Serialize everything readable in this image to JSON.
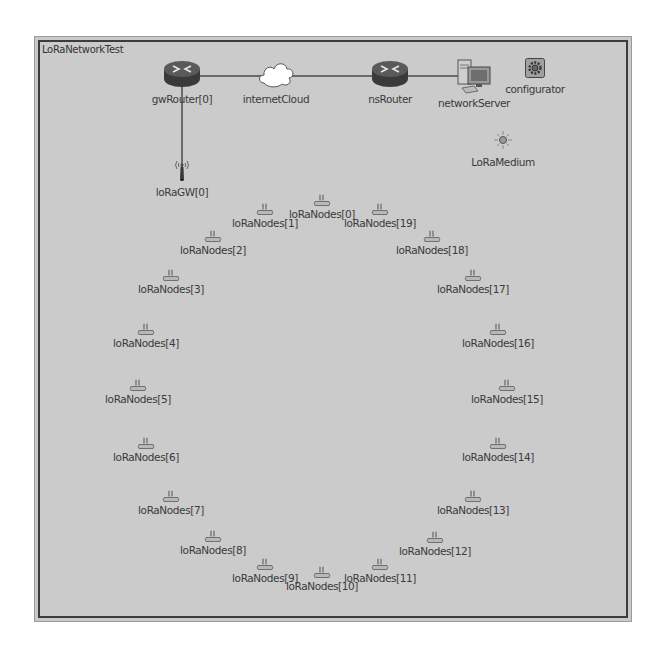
{
  "network": {
    "title": "LoRaNetworkTest",
    "background": "#cbcbcb",
    "border_color": "#3c3c3c"
  },
  "modules": {
    "gwRouter": {
      "label": "gwRouter[0]",
      "icon": "router-icon"
    },
    "internetCloud": {
      "label": "internetCloud",
      "icon": "cloud-icon"
    },
    "nsRouter": {
      "label": "nsRouter",
      "icon": "router-icon"
    },
    "networkServer": {
      "label": "networkServer",
      "icon": "server-icon"
    },
    "configurator": {
      "label": "configurator",
      "icon": "gear-icon"
    },
    "loRaMedium": {
      "label": "LoRaMedium",
      "icon": "radio-medium-icon"
    },
    "loRaGW": {
      "label": "loRaGW[0]",
      "icon": "antenna-icon"
    }
  },
  "links": [
    {
      "from": "gwRouter[0]",
      "to": "internetCloud"
    },
    {
      "from": "internetCloud",
      "to": "nsRouter"
    },
    {
      "from": "nsRouter",
      "to": "networkServer"
    },
    {
      "from": "gwRouter[0]",
      "to": "loRaGW[0]"
    }
  ],
  "nodes": [
    {
      "label": "loRaNodes[0]"
    },
    {
      "label": "loRaNodes[1]"
    },
    {
      "label": "loRaNodes[2]"
    },
    {
      "label": "loRaNodes[3]"
    },
    {
      "label": "loRaNodes[4]"
    },
    {
      "label": "loRaNodes[5]"
    },
    {
      "label": "loRaNodes[6]"
    },
    {
      "label": "loRaNodes[7]"
    },
    {
      "label": "loRaNodes[8]"
    },
    {
      "label": "loRaNodes[9]"
    },
    {
      "label": "loRaNodes[10]"
    },
    {
      "label": "loRaNodes[11]"
    },
    {
      "label": "loRaNodes[12]"
    },
    {
      "label": "loRaNodes[13]"
    },
    {
      "label": "loRaNodes[14]"
    },
    {
      "label": "loRaNodes[15]"
    },
    {
      "label": "loRaNodes[16]"
    },
    {
      "label": "loRaNodes[17]"
    },
    {
      "label": "loRaNodes[18]"
    },
    {
      "label": "loRaNodes[19]"
    }
  ]
}
